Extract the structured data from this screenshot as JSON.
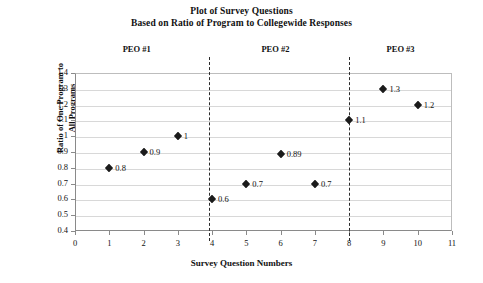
{
  "chart_data": {
    "type": "scatter",
    "title": "Plot of Survey Questions",
    "subtitle": "Based on Ratio of Program to Collegewide Responses",
    "xlabel": "Survey Question Numbers",
    "ylabel": "Ratio of One Program to\nAll Programs",
    "ylabel_line1": "Ratio of One Program to",
    "ylabel_line2": "All Programs",
    "xlim": [
      0,
      11
    ],
    "ylim": [
      0.4,
      1.4
    ],
    "grid": true,
    "legend": "none",
    "marker": "diamond",
    "marker_color": "#1b1b1b",
    "x": [
      1,
      2,
      3,
      4,
      5,
      6,
      7,
      8,
      9,
      10
    ],
    "values": [
      0.8,
      0.9,
      1,
      0.6,
      0.7,
      0.89,
      0.7,
      1.1,
      1.3,
      1.2
    ],
    "point_labels": [
      "0.8",
      "0.9",
      "1",
      "0.6",
      "0.7",
      "0.89",
      "0.7",
      "1.1",
      "1.3",
      "1.2"
    ],
    "xticks": [
      0,
      1,
      2,
      3,
      4,
      5,
      6,
      7,
      8,
      9,
      10,
      11
    ],
    "xtick_labels": [
      "0",
      "1",
      "2",
      "3",
      "4",
      "5",
      "6",
      "7",
      "8",
      "9",
      "10",
      "11"
    ],
    "yticks": [
      0.4,
      0.5,
      0.6,
      0.7,
      0.8,
      0.9,
      1.0,
      1.1,
      1.2,
      1.3,
      1.4
    ],
    "ytick_labels": [
      "0.4",
      "0.5",
      "0.6",
      "0.7",
      "0.8",
      "0.9",
      "1",
      "1.1",
      "1.2",
      "1.3",
      "1.4"
    ],
    "dividers": [
      {
        "x": 3.9,
        "style": "dashed"
      },
      {
        "x": 8.0,
        "style": "dashed"
      }
    ],
    "groups": [
      {
        "label": "PEO #1",
        "center_x": 1.8,
        "questions": [
          1,
          2,
          3
        ]
      },
      {
        "label": "PEO #2",
        "center_x": 5.85,
        "questions": [
          4,
          5,
          6,
          7
        ]
      },
      {
        "label": "PEO #3",
        "center_x": 9.5,
        "questions": [
          8,
          9,
          10
        ]
      }
    ]
  }
}
